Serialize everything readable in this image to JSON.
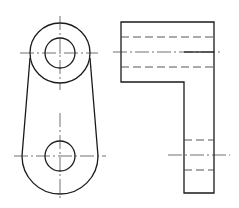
{
  "drawing": {
    "type": "orthographic-projection",
    "views": [
      "front-view",
      "side-view"
    ],
    "colors": {
      "line": "#1a1a1a",
      "background": "#ffffff"
    },
    "front_view": {
      "top_boss": {
        "cx": 60,
        "cy": 53,
        "outer_r": 30,
        "hole_r": 15
      },
      "bottom_end": {
        "cx": 60,
        "cy": 156,
        "outer_r": 39,
        "hole_r": 15
      }
    },
    "side_view": {
      "top_block": {
        "x": 121,
        "y": 22,
        "w": 93,
        "h": 60
      },
      "arm": {
        "x": 184,
        "y": 52,
        "w": 30,
        "h": 141
      }
    }
  }
}
